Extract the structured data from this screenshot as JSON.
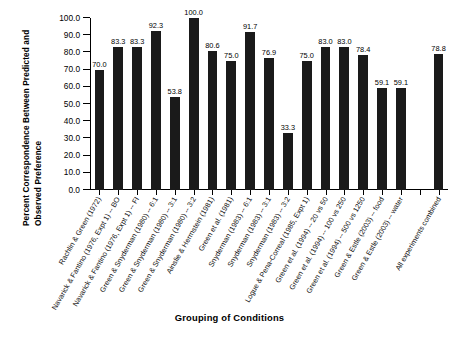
{
  "chart_data": {
    "type": "bar",
    "title": "",
    "xlabel": "Grouping of Conditions",
    "ylabel": "Percent Correspondence Between Predicted and Observed Preference",
    "ylabel_line1": "Percent Correspondence Between Predicted and",
    "ylabel_line2": "Observed Preference",
    "ylim": [
      0.0,
      100.0
    ],
    "ytick_labels": [
      "100.0",
      "90.0",
      "80.0",
      "70.0",
      "60.0",
      "50.0",
      "40.0",
      "30.0",
      "20.0",
      "10.0",
      "0.0"
    ],
    "ytick_values": [
      100.0,
      90.0,
      80.0,
      70.0,
      60.0,
      50.0,
      40.0,
      30.0,
      20.0,
      10.0,
      0.0
    ],
    "grid": false,
    "legend": false,
    "bar_color": "#1a1a1a",
    "categories": [
      "Rachlin & Green (1972)",
      "Navarick & Fantino (1976, Expt 1) -- BO",
      "Navarick & Fantino (1976, Expt 1) -- FI",
      "Green & Snyderman (1980) -- 6:1",
      "Green & Snyderman (1980) -- 3:1",
      "Green & Snyderman (1980) -- 3:2",
      "Ainslie & Herrnstein (1981)",
      "Green et al. (1981)",
      "Snyderman (1983) -- 6:1",
      "Snyderman (1983) -- 3:1",
      "Snyderman (1983) -- 3:2",
      "Logue & Pena-Correal (1985, Expt 1)",
      "Green et al. (1994) -- 20 vs 50",
      "Green et al. (1994) -- 100 vs 250",
      "Green et al. (1994) -- 500 vs 1250",
      "Green & Estle (2003) -- food",
      "Green & Estle (2003) -- water",
      "All experiments combined"
    ],
    "values": [
      70.0,
      83.3,
      83.3,
      92.3,
      53.8,
      100.0,
      80.6,
      75.0,
      91.7,
      76.9,
      33.3,
      75.0,
      83.0,
      83.0,
      78.4,
      59.1,
      59.1,
      78.8
    ],
    "value_labels": [
      "70.0",
      "83.3",
      "83.3",
      "92.3",
      "53.8",
      "100.0",
      "80.6",
      "75.0",
      "91.7",
      "76.9",
      "33.3",
      "75.0",
      "83.0",
      "83.0",
      "78.4",
      "59.1",
      "59.1",
      "78.8"
    ],
    "gap_before_last": true
  }
}
